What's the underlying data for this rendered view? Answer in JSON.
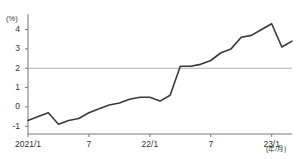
{
  "chart_data": {
    "type": "line",
    "title": "",
    "subtitle": "",
    "xlabel": "(年/月)",
    "ylabel": "(%)",
    "ylim": [
      -1.4,
      4.7
    ],
    "xlim": [
      0,
      26
    ],
    "grid": false,
    "legend": null,
    "reference_lines": [
      {
        "value": 2,
        "label": "2",
        "color": "#b0b0b0"
      }
    ],
    "y_ticks": [
      -1,
      0,
      1,
      2,
      3,
      4
    ],
    "y_tick_labels": [
      "-1",
      "0",
      "1",
      "2",
      "3",
      "4"
    ],
    "x_ticks": [
      0,
      6,
      12,
      18,
      24
    ],
    "x_tick_labels": [
      "2021/1",
      "7",
      "22/1",
      "7",
      "23/1"
    ],
    "x": [
      "2021/1",
      "2021/2",
      "2021/3",
      "2021/4",
      "2021/5",
      "2021/6",
      "2021/7",
      "2021/8",
      "2021/9",
      "2021/10",
      "2021/11",
      "2021/12",
      "2022/1",
      "2022/2",
      "2022/3",
      "2022/4",
      "2022/5",
      "2022/6",
      "2022/7",
      "2022/8",
      "2022/9",
      "2022/10",
      "2022/11",
      "2022/12",
      "2023/1",
      "2023/2",
      "2023/3"
    ],
    "series": [
      {
        "name": "前年同月比",
        "color": "#3a3a3a",
        "values": [
          -0.7,
          -0.5,
          -0.3,
          -0.9,
          -0.7,
          -0.6,
          -0.3,
          -0.1,
          0.1,
          0.2,
          0.4,
          0.5,
          0.5,
          0.3,
          0.6,
          2.1,
          2.1,
          2.2,
          2.4,
          2.8,
          3.0,
          3.6,
          3.7,
          4.0,
          4.3,
          3.1,
          3.4
        ]
      }
    ]
  },
  "axis": {
    "y_unit": "(%)",
    "x_unit": "(年/月)"
  }
}
